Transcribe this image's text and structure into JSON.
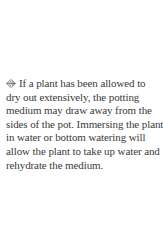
{
  "tip": {
    "icon": "leaf-ornament-icon",
    "text_color": "#3a3a3a",
    "lines": [
      "If a plant has been allowed to",
      "dry out extensively, the potting",
      "medium may draw away from the",
      "sides of the pot. Immersing the plant",
      "in water or bottom watering will",
      "allow the plant to take up water and",
      "rehydrate the medium."
    ],
    "full_text": "If a plant has been allowed to dry out extensively, the potting medium may draw away from the sides of the pot. Immersing the plant in water or bottom watering will allow the plant to take up water and rehydrate the medium."
  }
}
